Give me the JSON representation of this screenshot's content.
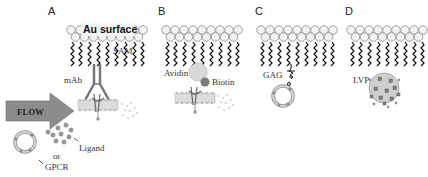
{
  "figure": {
    "panels": [
      {
        "id": "A",
        "letter": "A",
        "surface_label": "Au surface",
        "sam_label": "SAM",
        "capture_label": "mAb"
      },
      {
        "id": "B",
        "letter": "B",
        "capture_label": "Avidin",
        "linker_label": "Biotin"
      },
      {
        "id": "C",
        "letter": "C",
        "capture_label": "GAG"
      },
      {
        "id": "D",
        "letter": "D",
        "capture_label": "LVP"
      }
    ],
    "flow_label": "FLOW",
    "ligand_label": "Ligand",
    "or_label": "or",
    "gpcr_label": "GPCR"
  },
  "colors": {
    "headgroup_fill": "#f2f2f2",
    "headgroup_stroke": "#8a8a8a",
    "chain": "#111111",
    "arrow_fill": "#8c8c8c",
    "membrane": "#d8d8d8",
    "ligand_dot": "#9a9a9a",
    "avidin": "#d9d9d9",
    "biotin": "#7a7a7a",
    "lvp_body": "#cfcfcf"
  }
}
